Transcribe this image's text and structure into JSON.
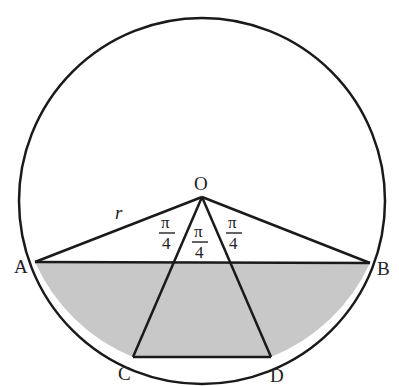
{
  "diagram": {
    "title": "",
    "labels": {
      "O": "O",
      "A": "A",
      "B": "B",
      "C": "C",
      "D": "D",
      "r": "r"
    },
    "angles": [
      {
        "num": "π",
        "den": "4",
        "between": "OA-OC"
      },
      {
        "num": "π",
        "den": "4",
        "between": "OC-OD"
      },
      {
        "num": "π",
        "den": "4",
        "between": "OD-OB"
      }
    ],
    "colors": {
      "stroke": "#1a1a1a",
      "shade": "#c8c8c8",
      "background": "#ffffff"
    }
  }
}
